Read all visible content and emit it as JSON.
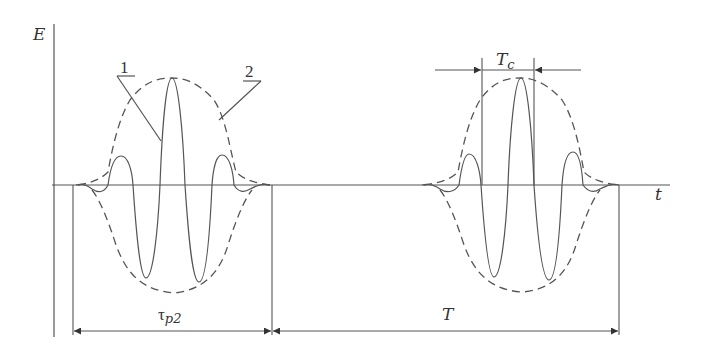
{
  "diagram": {
    "type": "waveform",
    "axes": {
      "y_label": "E",
      "x_label": "t"
    },
    "callouts": [
      {
        "id": "1",
        "label": "1",
        "refers_to": "oscillating field (solid)"
      },
      {
        "id": "2",
        "label": "2",
        "refers_to": "envelope (dashed)"
      }
    ],
    "dimensions": {
      "tau": {
        "label_main": "τ",
        "label_sub": "p2",
        "meaning": "pulse duration"
      },
      "period": {
        "label": "T",
        "meaning": "pulse repetition period"
      },
      "carrier": {
        "label_main": "T",
        "label_sub": "c",
        "meaning": "carrier oscillation period"
      }
    },
    "colors": {
      "line": "#555555",
      "background": "#ffffff"
    }
  }
}
